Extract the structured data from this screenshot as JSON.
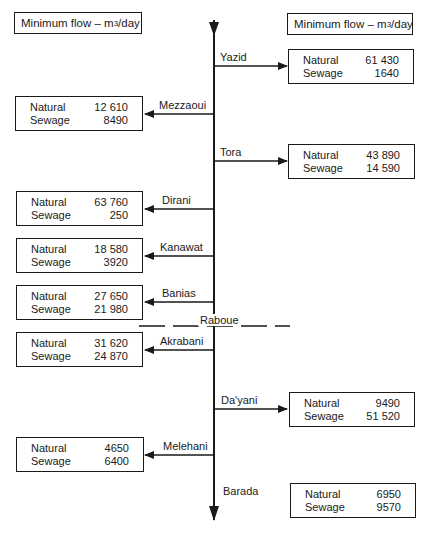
{
  "title": "Minimum flow – m3/day",
  "legend_left": {
    "text": "Minimum flow – m",
    "sup": "3",
    "unit": "/day"
  },
  "legend_right": {
    "text": "Minimum flow – m",
    "sup": "3",
    "unit": "/day"
  },
  "river": {
    "name": "Barada",
    "divider": "Raboue"
  },
  "row_labels": {
    "natural": "Natural",
    "sewage": "Sewage"
  },
  "branches": [
    {
      "name": "Yazid",
      "side": "right",
      "natural": "61 430",
      "sewage": "1640"
    },
    {
      "name": "Mezzaoui",
      "side": "left",
      "natural": "12 610",
      "sewage": "8490"
    },
    {
      "name": "Tora",
      "side": "right",
      "natural": "43 890",
      "sewage": "14 590"
    },
    {
      "name": "Dirani",
      "side": "left",
      "natural": "63 760",
      "sewage": "250"
    },
    {
      "name": "Kanawat",
      "side": "left",
      "natural": "18 580",
      "sewage": "3920"
    },
    {
      "name": "Banias",
      "side": "left",
      "natural": "27 650",
      "sewage": "21 980"
    },
    {
      "name": "Akrabani",
      "side": "left",
      "natural": "31 620",
      "sewage": "24 870"
    },
    {
      "name": "Da'yani",
      "side": "right",
      "natural": "9490",
      "sewage": "51 520"
    },
    {
      "name": "Melehani",
      "side": "left",
      "natural": "4650",
      "sewage": "6400"
    }
  ],
  "outlet": {
    "name": "Barada",
    "natural": "6950",
    "sewage": "9570"
  }
}
